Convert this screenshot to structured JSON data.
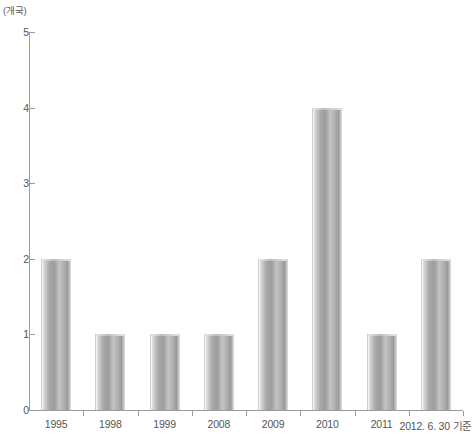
{
  "chart_data": {
    "type": "bar",
    "title": "",
    "subtitle": "",
    "xlabel": "",
    "ylabel": "(개국)",
    "ylim": [
      0,
      5
    ],
    "yticks": [
      0,
      1,
      2,
      3,
      4,
      5
    ],
    "grid": false,
    "legend": null,
    "categories": [
      "1995",
      "1998",
      "1999",
      "2008",
      "2009",
      "2010",
      "2011",
      "2012. 6. 30 기준"
    ],
    "values": [
      2,
      1,
      1,
      1,
      2,
      4,
      1,
      2
    ],
    "bar_color": "#a8a8a8",
    "axis_color": "#9b9b9b",
    "text_color": "#555555"
  }
}
